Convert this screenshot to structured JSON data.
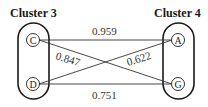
{
  "clusters": [
    {
      "title": "Cluster 3",
      "nodes": [
        "C",
        "D"
      ]
    },
    {
      "title": "Cluster 4",
      "nodes": [
        "A",
        "G"
      ]
    }
  ],
  "edges": [
    {
      "from": "C",
      "to": "A",
      "weight": "0.959"
    },
    {
      "from": "C",
      "to": "G",
      "weight": "0.847"
    },
    {
      "from": "D",
      "to": "A",
      "weight": "0.622"
    },
    {
      "from": "D",
      "to": "G",
      "weight": "0.751"
    }
  ],
  "colors": {
    "stroke": "#1a1a1a",
    "background": "#ffffff"
  }
}
